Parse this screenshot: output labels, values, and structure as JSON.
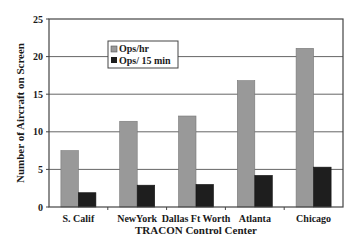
{
  "chart_data": {
    "type": "bar",
    "title": "",
    "xlabel": "TRACON Control Center",
    "ylabel": "Number of Aircraft on Screen",
    "ylim": [
      0,
      25
    ],
    "yticks": [
      0,
      5,
      10,
      15,
      20,
      25
    ],
    "grid": true,
    "legend_position": "upper-left-inside",
    "categories": [
      "S. Calif",
      "NewYork",
      "Dallas Ft Worth",
      "Atlanta",
      "Chicago"
    ],
    "series": [
      {
        "name": "Ops/hr",
        "color": "#999999",
        "values": [
          7.5,
          11.4,
          12.1,
          16.8,
          21.1
        ]
      },
      {
        "name": "Ops/ 15 min",
        "color": "#1e1e1e",
        "values": [
          1.9,
          2.9,
          3.0,
          4.2,
          5.3
        ]
      }
    ]
  },
  "colors": {
    "axis": "#444444",
    "grid": "#555555",
    "background": "#ffffff"
  }
}
